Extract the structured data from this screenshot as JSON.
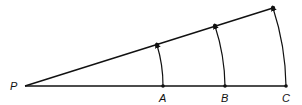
{
  "diagram": {
    "type": "geometric-rotation-arcs",
    "labels": {
      "origin": "P",
      "points": [
        "A",
        "B",
        "C"
      ]
    },
    "colors": {
      "stroke": "#111111",
      "background": "#ffffff"
    }
  }
}
